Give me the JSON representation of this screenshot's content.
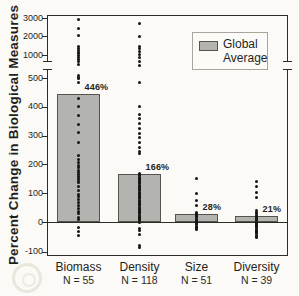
{
  "colors": {
    "background": "#fbfaf6",
    "bar_fill": "#b3b3af",
    "bar_border": "#55554f",
    "frame": "#2b2b28",
    "dot": "#161614",
    "ink": "#1f1f1d"
  },
  "legend": {
    "line1": "Global",
    "line2": "Average",
    "swatch_color": "#b3b3af"
  },
  "chart_data": {
    "type": "bar",
    "subtype": "bar-with-scatter-overlay",
    "title": "",
    "xlabel": "",
    "ylabel": "Percent Change in Biological Measures",
    "grid": false,
    "legend_label": "Global Average",
    "legend_position": "top-right",
    "ylim": [
      -115,
      3170
    ],
    "axis_break": {
      "below": 500,
      "above": 1000
    },
    "y_ticks": [
      {
        "v": 3000,
        "label": "3000"
      },
      {
        "v": 2000,
        "label": "2000"
      },
      {
        "v": 1000,
        "label": "1000"
      },
      {
        "v": 500,
        "label": "500"
      },
      {
        "v": 400,
        "label": "400"
      },
      {
        "v": 300,
        "label": "300"
      },
      {
        "v": 200,
        "label": "200"
      },
      {
        "v": 100,
        "label": "100"
      },
      {
        "v": 0,
        "label": "0"
      },
      {
        "v": -100,
        "label": "-100"
      }
    ],
    "categories": [
      {
        "label": "Biomass",
        "n_label": "N = 55",
        "bar_value": 446,
        "bar_label": "446%",
        "points": [
          2900,
          2400,
          2050,
          1450,
          1350,
          1250,
          1150,
          1060,
          1000,
          950,
          900,
          850,
          800,
          560,
          510,
          497,
          486,
          430,
          400,
          370,
          340,
          310,
          275,
          232,
          218,
          205,
          196,
          188,
          180,
          172,
          164,
          157,
          150,
          143,
          136,
          122,
          108,
          96,
          88,
          78,
          68,
          58,
          48,
          38,
          28,
          16,
          8,
          -20,
          -33,
          -45
        ]
      },
      {
        "label": "Density",
        "n_label": "N = 118",
        "bar_value": 166,
        "bar_label": "166%",
        "points": [
          2700,
          2000,
          1470,
          1330,
          1180,
          1050,
          950,
          860,
          770,
          485,
          400,
          375,
          358,
          342,
          325,
          308,
          292,
          276,
          260,
          246,
          238,
          168,
          164,
          160,
          156,
          152,
          148,
          144,
          140,
          136,
          132,
          128,
          124,
          120,
          116,
          112,
          108,
          104,
          100,
          96,
          92,
          88,
          84,
          80,
          76,
          72,
          68,
          64,
          60,
          56,
          52,
          48,
          44,
          40,
          36,
          32,
          28,
          24,
          20,
          16,
          12,
          8,
          4,
          0,
          -22,
          -30,
          -42,
          -80,
          -85
        ]
      },
      {
        "label": "Size",
        "n_label": "N = 51",
        "bar_value": 28,
        "bar_label": "28%",
        "points": [
          152,
          100,
          76,
          59,
          34,
          30,
          26,
          22,
          18,
          14,
          10,
          6,
          2,
          -2,
          -6,
          -10,
          -14,
          -18,
          -22,
          -26
        ]
      },
      {
        "label": "Diversity",
        "n_label": "N = 39",
        "bar_value": 21,
        "bar_label": "21%",
        "points": [
          142,
          124,
          104,
          86,
          41,
          32,
          28,
          24,
          20,
          16,
          12,
          8,
          4,
          0,
          -4,
          -8,
          -12,
          -16,
          -20,
          -24,
          -28,
          -32,
          -36,
          -40,
          -44,
          -48,
          -52
        ]
      }
    ]
  }
}
